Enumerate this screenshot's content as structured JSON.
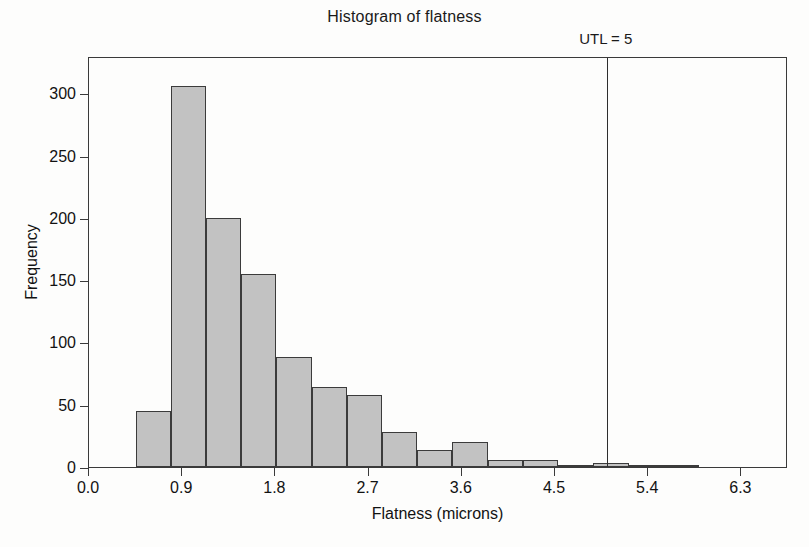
{
  "chart_data": {
    "type": "bar",
    "title": "Histogram of flatness",
    "xlabel": "Flatness (microns)",
    "ylabel": "Frequency",
    "xlim": [
      0.0,
      6.75
    ],
    "ylim": [
      0,
      330
    ],
    "grid": false,
    "legend": null,
    "bin_width": 0.34,
    "categories": [
      "0.45-0.79",
      "0.79-1.13",
      "1.13-1.47",
      "1.47-1.81",
      "1.81-2.15",
      "2.15-2.49",
      "2.49-2.83",
      "2.83-3.17",
      "3.17-3.51",
      "3.51-3.85",
      "3.85-4.19",
      "4.19-4.53",
      "4.53-4.87",
      "4.87-5.21",
      "5.21-5.55",
      "5.55-5.89"
    ],
    "bin_centers": [
      0.62,
      0.96,
      1.3,
      1.64,
      1.98,
      2.32,
      2.66,
      3.0,
      3.34,
      3.68,
      4.02,
      4.36,
      4.7,
      5.04,
      5.38,
      5.72
    ],
    "values": [
      45,
      306,
      200,
      155,
      88,
      64,
      58,
      28,
      14,
      20,
      6,
      6,
      2,
      3,
      1,
      1
    ],
    "x_ticks": [
      0.0,
      0.9,
      1.8,
      2.7,
      3.6,
      4.5,
      5.4,
      6.3
    ],
    "x_tick_labels": [
      "0.0",
      "0.9",
      "1.8",
      "2.7",
      "3.6",
      "4.5",
      "5.4",
      "6.3"
    ],
    "y_ticks": [
      0,
      50,
      100,
      150,
      200,
      250,
      300
    ],
    "y_tick_labels": [
      "0",
      "50",
      "100",
      "150",
      "200",
      "250",
      "300"
    ],
    "annotations": [
      {
        "name": "utl-reference-line",
        "label": "UTL = 5",
        "value": 5,
        "orientation": "vertical"
      }
    ],
    "colors": {
      "bar_fill": "#c2c2c2",
      "bar_edge": "#3b3b3b",
      "axis": "#3a3a3a",
      "text": "#121212",
      "reference_line": "#2e2e2e",
      "background": "#fdfdfc"
    }
  }
}
